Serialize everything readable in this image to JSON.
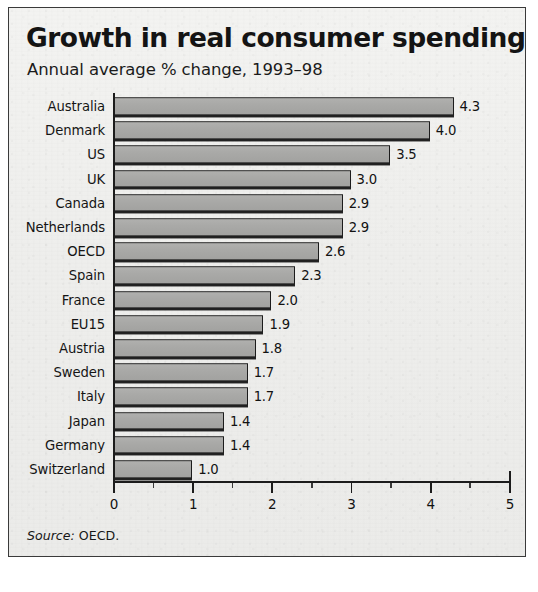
{
  "chart_card": {
    "title": "Growth in real consumer spending",
    "subtitle": "Annual average % change, 1993–98",
    "source_word": "Source:",
    "source_value": "OECD.",
    "frame_color": "#3a3a3a",
    "paper_color": "#eeeeec",
    "bar_fill": "#a9a9a7",
    "bar_stroke": "#1c1c1c"
  },
  "chart_data": {
    "type": "bar",
    "orientation": "horizontal",
    "title": "Growth in real consumer spending",
    "subtitle": "Annual average % change, 1993–98",
    "xlabel": "",
    "ylabel": "",
    "xlim": [
      0,
      5
    ],
    "grid": false,
    "legend": null,
    "source": "Source: OECD.",
    "x_ticks": [
      0,
      1,
      2,
      3,
      4,
      5
    ],
    "x_tick_labels": [
      "0",
      "1",
      "2",
      "3",
      "4",
      "5"
    ],
    "x_minor_ticks": [
      0.5,
      1.5,
      2.5,
      3.5,
      4.5
    ],
    "categories": [
      "Australia",
      "Denmark",
      "US",
      "UK",
      "Canada",
      "Netherlands",
      "OECD",
      "Spain",
      "France",
      "EU15",
      "Austria",
      "Sweden",
      "Italy",
      "Japan",
      "Germany",
      "Switzerland"
    ],
    "values": [
      4.3,
      4.0,
      3.5,
      3.0,
      2.9,
      2.9,
      2.6,
      2.3,
      2.0,
      1.9,
      1.8,
      1.7,
      1.7,
      1.4,
      1.4,
      1.0
    ],
    "data_labels": [
      "4.3",
      "4.0",
      "3.5",
      "3.0",
      "2.9",
      "2.9",
      "2.6",
      "2.3",
      "2.0",
      "1.9",
      "1.8",
      "1.7",
      "1.7",
      "1.4",
      "1.4",
      "1.0"
    ]
  }
}
